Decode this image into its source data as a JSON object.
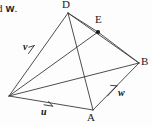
{
  "figure": {
    "caption_fragment": "d ",
    "caption_vector": "w",
    "caption_period": ".",
    "background_color": "#fdfdfd",
    "line_color": "#3a3a3a",
    "text_color": "#191919",
    "vertices": [
      {
        "id": "C",
        "label": "C",
        "x": 9,
        "y": 96,
        "visible_label": false
      },
      {
        "id": "D",
        "label": "D",
        "x": 68,
        "y": 13,
        "visible_label": true
      },
      {
        "id": "A",
        "label": "A",
        "x": 93,
        "y": 110,
        "visible_label": true
      },
      {
        "id": "B",
        "label": "B",
        "x": 139,
        "y": 63,
        "visible_label": true
      },
      {
        "id": "E",
        "label": "E",
        "x": 98,
        "y": 32,
        "visible_label": true
      }
    ],
    "edges": [
      {
        "from": "C",
        "to": "D"
      },
      {
        "from": "C",
        "to": "A"
      },
      {
        "from": "C",
        "to": "B"
      },
      {
        "from": "C",
        "to": "E"
      },
      {
        "from": "D",
        "to": "A"
      },
      {
        "from": "D",
        "to": "B"
      },
      {
        "from": "A",
        "to": "B"
      },
      {
        "from": "E",
        "to": "B"
      },
      {
        "from": "D",
        "to": "E"
      }
    ],
    "vectors": [
      {
        "name": "v",
        "label": "v",
        "from": "C",
        "to": "D",
        "label_x": 23,
        "label_y": 42
      },
      {
        "name": "u",
        "label": "u",
        "from": "C",
        "to": "A",
        "label_x": 41,
        "label_y": 107
      },
      {
        "name": "w",
        "label": "w",
        "from": "A",
        "to": "B",
        "label_x": 118,
        "label_y": 88
      }
    ],
    "point_marker": {
      "at": "E",
      "x": 98,
      "y": 32,
      "radius": 2.1
    },
    "vertex_labels": [
      {
        "text": "D",
        "x": 63,
        "y": 0
      },
      {
        "text": "E",
        "x": 96,
        "y": 14
      },
      {
        "text": "B",
        "x": 141,
        "y": 56
      },
      {
        "text": "A",
        "x": 87,
        "y": 112
      }
    ]
  }
}
